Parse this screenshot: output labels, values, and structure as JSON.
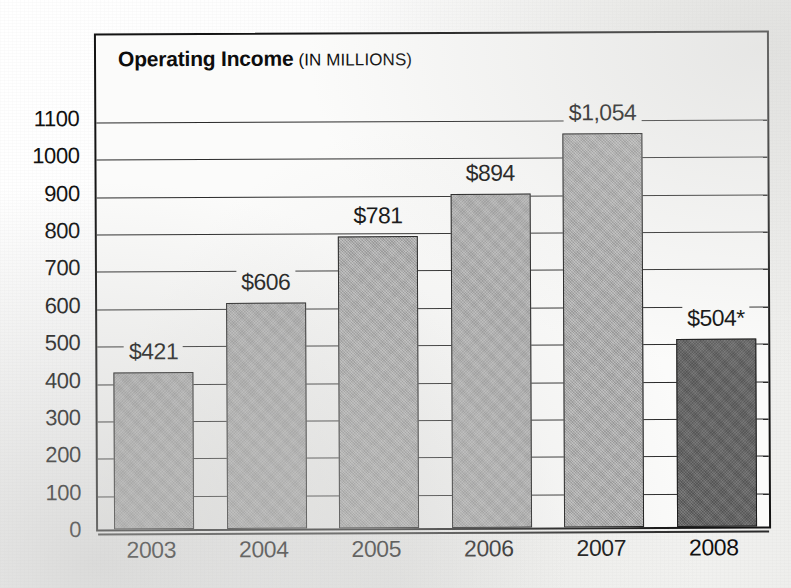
{
  "title": {
    "main": "Operating Income",
    "sub": "(IN MILLIONS)"
  },
  "chart_data": {
    "type": "bar",
    "xlabel": "",
    "ylabel": "",
    "ylim": [
      0,
      1100
    ],
    "ytick_step": 100,
    "grid": true,
    "legend": false,
    "categories": [
      "2003",
      "2004",
      "2005",
      "2006",
      "2007",
      "2008"
    ],
    "values": [
      421,
      606,
      781,
      894,
      1054,
      504
    ],
    "value_labels": [
      "$421",
      "$606",
      "$781",
      "$894",
      "$1,054",
      "$504*"
    ],
    "ytick_labels": [
      "0",
      "100",
      "200",
      "300",
      "400",
      "500",
      "600",
      "700",
      "800",
      "900",
      "1000",
      "1100"
    ],
    "highlight_index": 5,
    "footnote_marker": "*",
    "colors": {
      "bar_fill": "#a9a9a9",
      "bar_highlight_fill": "#636363",
      "bar_outline": "#1a1a1a",
      "grid": "#2a2a2a",
      "frame": "#141414",
      "text": "#0f0f0f",
      "plot_background": "#fbfbfa",
      "page_background": "#f6f6f4"
    }
  }
}
